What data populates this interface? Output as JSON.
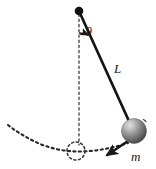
{
  "figure": {
    "background_color": "#ffffff",
    "stroke_color": "#1a1a1a",
    "dash_color": "#2b2b2b"
  },
  "labels": {
    "angle": "θ",
    "length": "L",
    "mass": "m"
  },
  "elements": {
    "pivot": {
      "name": "pivot-point",
      "cx": 79,
      "cy": 11,
      "r": 4.2,
      "color": "#111111"
    },
    "rod": {
      "name": "pendulum-rod",
      "x1": 79,
      "y1": 11,
      "x2": 133,
      "y2": 130,
      "width": 2.6
    },
    "vertical_reference": {
      "name": "vertical-dashed-line",
      "x1": 79,
      "y1": 14,
      "x2": 79,
      "y2": 145
    },
    "bob": {
      "name": "pendulum-bob",
      "cx": 134,
      "cy": 131,
      "r": 12.5,
      "fill_light": "#d2d2d2",
      "fill_dark": "#4a4a4a"
    },
    "velocity_arrow": {
      "name": "velocity-arrow",
      "x1": 131,
      "y1": 139,
      "x2": 104,
      "y2": 157
    },
    "angle_arc": {
      "name": "angle-arc",
      "radius": 22,
      "start_deg": -90,
      "end_deg": -65
    },
    "equilibrium_circle": {
      "name": "equilibrium-dashed-circle",
      "cx": 76,
      "cy": 151,
      "r": 9
    },
    "trajectory_arc": {
      "name": "trajectory-dashed-arc",
      "start_x": 8,
      "start_y": 125,
      "end_x": 128,
      "end_y": 143
    }
  },
  "label_positions": {
    "theta": {
      "x": 86,
      "y": 36
    },
    "L": {
      "x": 114,
      "y": 73
    },
    "m": {
      "x": 132,
      "y": 161
    }
  }
}
